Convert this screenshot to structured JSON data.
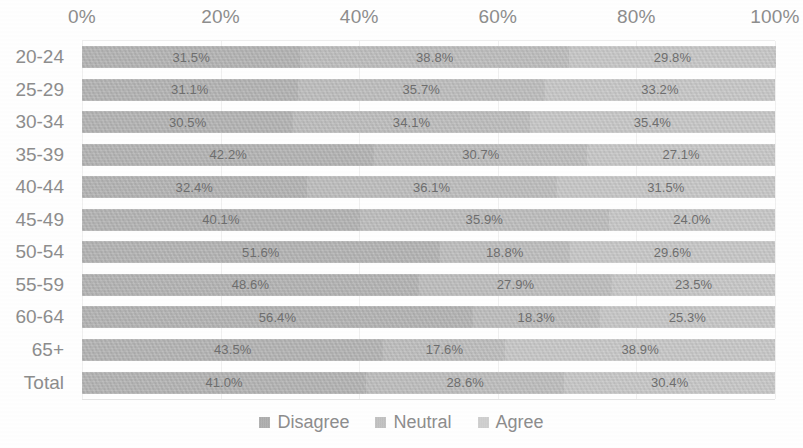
{
  "chart_data": {
    "type": "bar",
    "subtype": "100% stacked horizontal bar",
    "title": "",
    "xlabel": "",
    "ylabel": "",
    "xlim": [
      0,
      100
    ],
    "grid": true,
    "legend_position": "bottom",
    "x_tick_labels": [
      "0%",
      "20%",
      "40%",
      "60%",
      "80%",
      "100%"
    ],
    "x_tick_values": [
      0,
      20,
      40,
      60,
      80,
      100
    ],
    "categories": [
      "20-24",
      "25-29",
      "30-34",
      "35-39",
      "40-44",
      "45-49",
      "50-54",
      "55-59",
      "60-64",
      "65+",
      "Total"
    ],
    "series": [
      {
        "name": "Disagree",
        "color": "#b2b2b2",
        "values": [
          31.5,
          31.1,
          30.5,
          42.2,
          32.4,
          40.1,
          51.6,
          48.6,
          56.4,
          43.5,
          41.0
        ],
        "labels": [
          "31.5%",
          "31.1%",
          "30.5%",
          "42.2%",
          "32.4%",
          "40.1%",
          "51.6%",
          "48.6%",
          "56.4%",
          "43.5%",
          "41.0%"
        ]
      },
      {
        "name": "Neutral",
        "color": "#bdbdbd",
        "values": [
          38.8,
          35.7,
          34.1,
          30.7,
          36.1,
          35.9,
          18.8,
          27.9,
          18.3,
          17.6,
          28.6
        ],
        "labels": [
          "38.8%",
          "35.7%",
          "34.1%",
          "30.7%",
          "36.1%",
          "35.9%",
          "18.8%",
          "27.9%",
          "18.3%",
          "17.6%",
          "28.6%"
        ]
      },
      {
        "name": "Agree",
        "color": "#c8c8c8",
        "values": [
          29.8,
          33.2,
          35.4,
          27.1,
          31.5,
          24.0,
          29.6,
          23.5,
          25.3,
          38.9,
          30.4
        ],
        "labels": [
          "29.8%",
          "33.2%",
          "35.4%",
          "27.1%",
          "31.5%",
          "24.0%",
          "29.6%",
          "23.5%",
          "25.3%",
          "38.9%",
          "30.4%"
        ]
      }
    ]
  },
  "legend": {
    "items": [
      {
        "label": "Disagree",
        "swatch": "legend-swatch-disagree"
      },
      {
        "label": "Neutral",
        "swatch": "legend-swatch-neutral"
      },
      {
        "label": "Agree",
        "swatch": "legend-swatch-agree"
      }
    ]
  },
  "colors": {
    "disagree": "#b2b2b2",
    "neutral": "#bdbdbd",
    "agree": "#c8c8c8",
    "text": "#8d8d8d",
    "gridline": "#f0f0f0",
    "background": "#ffffff"
  }
}
